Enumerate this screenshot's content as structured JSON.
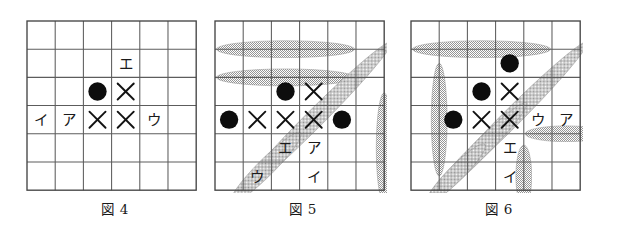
{
  "page": {
    "background": "#ffffff",
    "line_color": "#5c5c5c",
    "stone_color": "#0d0d0d",
    "mark_color": "#121212",
    "ellipse_color": "#9a9a9a"
  },
  "figures": [
    {
      "id": "figure-4",
      "caption": "図 4",
      "grid": {
        "cols": 6,
        "rows": 6
      },
      "stones": [
        {
          "col": 3,
          "row": 3,
          "type": "black-stone"
        }
      ],
      "marks": [
        {
          "col": 4,
          "row": 3,
          "type": "x-mark"
        },
        {
          "col": 3,
          "row": 4,
          "type": "x-mark"
        },
        {
          "col": 4,
          "row": 4,
          "type": "x-mark"
        }
      ],
      "labels": [
        {
          "col": 4,
          "row": 2,
          "text": "エ"
        },
        {
          "col": 1,
          "row": 4,
          "text": "イ"
        },
        {
          "col": 2,
          "row": 4,
          "text": "ア"
        },
        {
          "col": 5,
          "row": 4,
          "text": "ウ"
        }
      ],
      "ellipses": []
    },
    {
      "id": "figure-5",
      "caption": "図 5",
      "grid": {
        "cols": 6,
        "rows": 6
      },
      "stones": [
        {
          "col": 3,
          "row": 3,
          "type": "black-stone"
        },
        {
          "col": 1,
          "row": 4,
          "type": "black-stone"
        },
        {
          "col": 5,
          "row": 4,
          "type": "black-stone"
        }
      ],
      "marks": [
        {
          "col": 4,
          "row": 3,
          "type": "x-mark"
        },
        {
          "col": 2,
          "row": 4,
          "type": "x-mark"
        },
        {
          "col": 3,
          "row": 4,
          "type": "x-mark"
        },
        {
          "col": 4,
          "row": 4,
          "type": "x-mark"
        }
      ],
      "labels": [
        {
          "col": 3,
          "row": 5,
          "text": "エ"
        },
        {
          "col": 4,
          "row": 5,
          "text": "ア"
        },
        {
          "col": 2,
          "row": 6,
          "text": "ウ"
        },
        {
          "col": 4,
          "row": 6,
          "text": "イ"
        }
      ],
      "ellipses": [
        {
          "name": "row-1-horizontal",
          "cx": 2.5,
          "cy": 1.0,
          "rx": 2.45,
          "ry": 0.3,
          "angle": 0
        },
        {
          "name": "row-2-horizontal",
          "cx": 2.5,
          "cy": 2.0,
          "rx": 2.45,
          "ry": 0.3,
          "angle": 0
        },
        {
          "name": "col-6-vertical",
          "cx": 6.0,
          "cy": 4.5,
          "rx": 0.28,
          "ry": 1.95,
          "angle": 0
        },
        {
          "name": "long-diagonal-up",
          "cx": 3.5,
          "cy": 3.5,
          "rx": 3.9,
          "ry": 0.32,
          "angle": -45
        },
        {
          "name": "short-diagonal-up",
          "cx": 1.8,
          "cy": 5.2,
          "rx": 1.75,
          "ry": 0.3,
          "angle": -45
        }
      ]
    },
    {
      "id": "figure-6",
      "caption": "図 6",
      "grid": {
        "cols": 6,
        "rows": 6
      },
      "stones": [
        {
          "col": 4,
          "row": 2,
          "type": "black-stone"
        },
        {
          "col": 3,
          "row": 3,
          "type": "black-stone"
        },
        {
          "col": 2,
          "row": 4,
          "type": "black-stone"
        }
      ],
      "marks": [
        {
          "col": 4,
          "row": 3,
          "type": "x-mark"
        },
        {
          "col": 3,
          "row": 4,
          "type": "x-mark"
        },
        {
          "col": 4,
          "row": 4,
          "type": "x-mark"
        }
      ],
      "labels": [
        {
          "col": 5,
          "row": 4,
          "text": "ウ"
        },
        {
          "col": 6,
          "row": 4,
          "text": "ア"
        },
        {
          "col": 4,
          "row": 5,
          "text": "エ"
        },
        {
          "col": 4,
          "row": 6,
          "text": "イ"
        }
      ],
      "ellipses": [
        {
          "name": "row-1-horizontal",
          "cx": 2.5,
          "cy": 1.0,
          "rx": 2.45,
          "ry": 0.3,
          "angle": 0
        },
        {
          "name": "row-4-horizontal-right",
          "cx": 5.5,
          "cy": 4.0,
          "rx": 1.45,
          "ry": 0.28,
          "angle": 0
        },
        {
          "name": "col-1-vertical",
          "cx": 1.0,
          "cy": 3.5,
          "rx": 0.28,
          "ry": 2.0,
          "angle": 0
        },
        {
          "name": "col-4-vertical-lower",
          "cx": 4.0,
          "cy": 5.5,
          "rx": 0.28,
          "ry": 1.1,
          "angle": 0
        },
        {
          "name": "long-diagonal-up",
          "cx": 3.5,
          "cy": 3.5,
          "rx": 3.9,
          "ry": 0.32,
          "angle": -45
        },
        {
          "name": "second-diagonal-up",
          "cx": 2.3,
          "cy": 4.7,
          "rx": 2.55,
          "ry": 0.3,
          "angle": -45
        },
        {
          "name": "short-diagonal-up",
          "cx": 1.6,
          "cy": 5.4,
          "rx": 1.45,
          "ry": 0.28,
          "angle": -45
        }
      ]
    }
  ]
}
